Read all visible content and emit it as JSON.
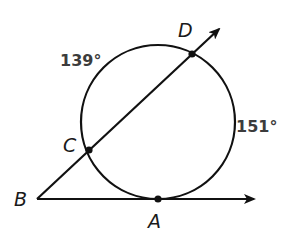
{
  "diagram": {
    "type": "circle-secant-tangent",
    "stroke_color": "#111111",
    "circle": {
      "cx": 158,
      "cy": 122,
      "r": 77
    },
    "points": {
      "A": {
        "label": "A",
        "x": 158,
        "y": 199
      },
      "B": {
        "label": "B",
        "x": 37,
        "y": 199
      },
      "C": {
        "label": "C",
        "x": 89,
        "y": 150
      },
      "D": {
        "label": "D",
        "x": 192,
        "y": 54
      }
    },
    "rays": [
      {
        "name": "ray-BD",
        "from": "B",
        "through": "D",
        "tip": {
          "x": 221,
          "y": 27
        }
      },
      {
        "name": "ray-BA",
        "from": "B",
        "through": "A",
        "tip": {
          "x": 256,
          "y": 199
        }
      }
    ],
    "arc_labels": {
      "upper_left": "139°",
      "right": "151°"
    }
  }
}
